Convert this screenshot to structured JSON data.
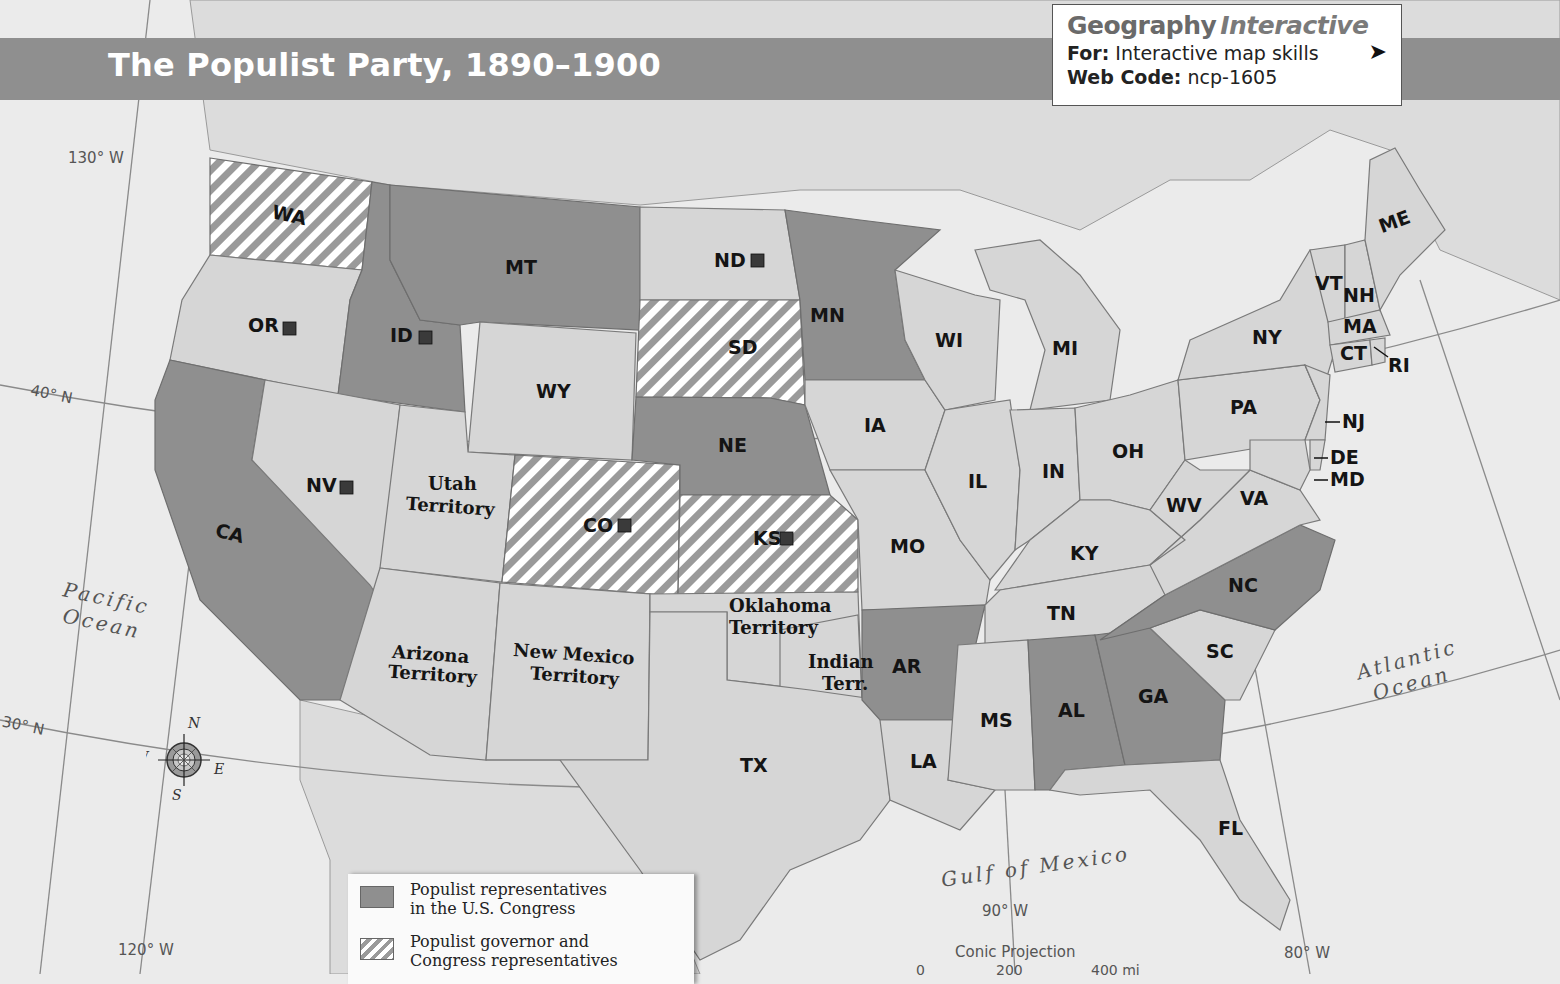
{
  "title": "The Populist Party, 1890–1900",
  "geography_interactive": {
    "brand_bold": "Geography",
    "brand_italic": "Interactive",
    "for_label": "For:",
    "for_value": "Interactive map skills",
    "webcode_label": "Web Code:",
    "webcode_value": "ncp-1605",
    "cursor_icon": "mouse-pointer-icon"
  },
  "legend": {
    "items": [
      {
        "pattern": "solid-gray",
        "color": "#8f8f8f",
        "line1": "Populist representatives",
        "line2": "in the U.S. Congress"
      },
      {
        "pattern": "gray-white-hatch",
        "color": "#9a9a9a",
        "line1": "Populist governor and",
        "line2": "Congress representatives"
      }
    ],
    "marker_note": "small dark square next to state label"
  },
  "colors": {
    "background": "#ebebeb",
    "title_bar": "#8f8f8f",
    "populist_rep": "#8f8f8f",
    "non_populist": "#d6d6d6",
    "hatch_stripe": "#9a9a9a"
  },
  "grid_labels": {
    "lon_130": "130° W",
    "lon_120": "120° W",
    "lon_90": "90° W",
    "lon_80": "80° W",
    "lat_40": "40° N",
    "lat_30": "30° N"
  },
  "water_labels": {
    "pacific_1": "Pacific",
    "pacific_2": "Ocean",
    "atlantic_1": "Atlantic",
    "atlantic_2": "Ocean",
    "gulf": "Gulf of Mexico"
  },
  "compass": {
    "n": "N",
    "s": "S",
    "e": "E",
    "w": "W"
  },
  "projection": "Conic Projection",
  "scale": {
    "s0": "0",
    "s1": "200",
    "s2": "400 mi"
  },
  "states": {
    "WA": {
      "label": "WA",
      "status": "governor_and_congress",
      "marker": false
    },
    "OR": {
      "label": "OR",
      "status": "none",
      "marker": true
    },
    "CA": {
      "label": "CA",
      "status": "congress",
      "marker": false
    },
    "ID": {
      "label": "ID",
      "status": "congress",
      "marker": true
    },
    "NV": {
      "label": "NV",
      "status": "none",
      "marker": true
    },
    "MT": {
      "label": "MT",
      "status": "congress",
      "marker": false
    },
    "WY": {
      "label": "WY",
      "status": "none",
      "marker": false
    },
    "UT": {
      "label1": "Utah",
      "label2": "Territory",
      "status": "none",
      "marker": false
    },
    "AZ": {
      "label1": "Arizona",
      "label2": "Territory",
      "status": "none",
      "marker": false
    },
    "NM": {
      "label1": "New Mexico",
      "label2": "Territory",
      "status": "none",
      "marker": false
    },
    "CO": {
      "label": "CO",
      "status": "governor_and_congress",
      "marker": true
    },
    "ND": {
      "label": "ND",
      "status": "none",
      "marker": true
    },
    "SD": {
      "label": "SD",
      "status": "governor_and_congress",
      "marker": false
    },
    "NE": {
      "label": "NE",
      "status": "congress",
      "marker": false
    },
    "KS": {
      "label": "KS",
      "status": "governor_and_congress",
      "marker": true
    },
    "OK": {
      "label1": "Oklahoma",
      "label2": "Territory",
      "status": "none",
      "marker": false
    },
    "IT": {
      "label1": "Indian",
      "label2": "Terr.",
      "status": "none",
      "marker": false
    },
    "TX": {
      "label": "TX",
      "status": "none",
      "marker": false
    },
    "MN": {
      "label": "MN",
      "status": "congress",
      "marker": false
    },
    "IA": {
      "label": "IA",
      "status": "none",
      "marker": false
    },
    "MO": {
      "label": "MO",
      "status": "none",
      "marker": false
    },
    "AR": {
      "label": "AR",
      "status": "congress",
      "marker": false
    },
    "LA": {
      "label": "LA",
      "status": "none",
      "marker": false
    },
    "WI": {
      "label": "WI",
      "status": "none",
      "marker": false
    },
    "IL": {
      "label": "IL",
      "status": "none",
      "marker": false
    },
    "MI": {
      "label": "MI",
      "status": "none",
      "marker": false
    },
    "IN": {
      "label": "IN",
      "status": "none",
      "marker": false
    },
    "OH": {
      "label": "OH",
      "status": "none",
      "marker": false
    },
    "KY": {
      "label": "KY",
      "status": "none",
      "marker": false
    },
    "TN": {
      "label": "TN",
      "status": "none",
      "marker": false
    },
    "MS": {
      "label": "MS",
      "status": "none",
      "marker": false
    },
    "AL": {
      "label": "AL",
      "status": "congress",
      "marker": false
    },
    "GA": {
      "label": "GA",
      "status": "congress",
      "marker": false
    },
    "FL": {
      "label": "FL",
      "status": "none",
      "marker": false
    },
    "SC": {
      "label": "SC",
      "status": "none",
      "marker": false
    },
    "NC": {
      "label": "NC",
      "status": "congress",
      "marker": false
    },
    "VA": {
      "label": "VA",
      "status": "none",
      "marker": false
    },
    "WV": {
      "label": "WV",
      "status": "none",
      "marker": false
    },
    "PA": {
      "label": "PA",
      "status": "none",
      "marker": false
    },
    "NY": {
      "label": "NY",
      "status": "none",
      "marker": false
    },
    "NJ": {
      "label": "NJ",
      "status": "none",
      "marker": false
    },
    "DE": {
      "label": "DE",
      "status": "none",
      "marker": false
    },
    "MD": {
      "label": "MD",
      "status": "none",
      "marker": false
    },
    "VT": {
      "label": "VT",
      "status": "none",
      "marker": false
    },
    "NH": {
      "label": "NH",
      "status": "none",
      "marker": false
    },
    "MA": {
      "label": "MA",
      "status": "none",
      "marker": false
    },
    "CT": {
      "label": "CT",
      "status": "none",
      "marker": false
    },
    "RI": {
      "label": "RI",
      "status": "none",
      "marker": false
    },
    "ME": {
      "label": "ME",
      "status": "none",
      "marker": false
    }
  }
}
